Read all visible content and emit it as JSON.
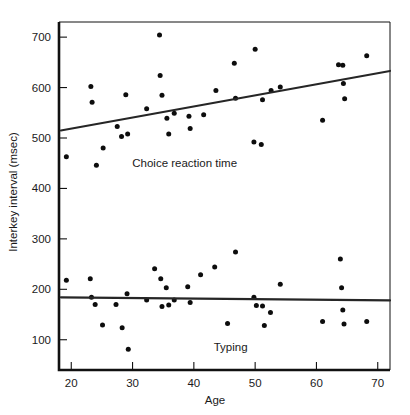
{
  "chart_data": {
    "type": "scatter",
    "title": "",
    "xlabel": "Age",
    "ylabel": "Interkey interval (msec)",
    "xlim": [
      18,
      72
    ],
    "ylim": [
      40,
      730
    ],
    "xticks": [
      20,
      30,
      40,
      50,
      60,
      70
    ],
    "yticks": [
      100,
      200,
      300,
      400,
      500,
      600,
      700
    ],
    "grid": false,
    "legend_position": "inline-annotation",
    "annotations": [
      {
        "text": "Choice reaction time",
        "x": 38.5,
        "y": 443
      },
      {
        "text": "Typing",
        "x": 46.0,
        "y": 78
      }
    ],
    "series": [
      {
        "name": "Choice reaction time",
        "label": "Choice reaction time",
        "color": "#0d0d0d",
        "marker": "circle",
        "points": [
          [
            19.2,
            463
          ],
          [
            23.2,
            602
          ],
          [
            23.4,
            571
          ],
          [
            24.1,
            446
          ],
          [
            25.2,
            480
          ],
          [
            27.5,
            523
          ],
          [
            28.2,
            503
          ],
          [
            28.9,
            586
          ],
          [
            29.2,
            508
          ],
          [
            32.3,
            558
          ],
          [
            34.4,
            704
          ],
          [
            34.5,
            624
          ],
          [
            34.8,
            585
          ],
          [
            35.6,
            539
          ],
          [
            35.9,
            508
          ],
          [
            36.8,
            549
          ],
          [
            39.2,
            543
          ],
          [
            39.4,
            519
          ],
          [
            41.6,
            546
          ],
          [
            43.6,
            594
          ],
          [
            46.6,
            648
          ],
          [
            46.8,
            579
          ],
          [
            49.8,
            492
          ],
          [
            50.0,
            676
          ],
          [
            51.0,
            487
          ],
          [
            51.2,
            576
          ],
          [
            52.6,
            594
          ],
          [
            54.1,
            601
          ],
          [
            61.0,
            535
          ],
          [
            63.6,
            645
          ],
          [
            64.3,
            644
          ],
          [
            64.4,
            608
          ],
          [
            64.6,
            578
          ],
          [
            68.2,
            663
          ]
        ],
        "trend_line": {
          "x": [
            18.3,
            72.0
          ],
          "y": [
            515,
            633
          ]
        }
      },
      {
        "name": "Typing",
        "label": "Typing",
        "color": "#0d0d0d",
        "marker": "circle",
        "points": [
          [
            19.2,
            218
          ],
          [
            23.1,
            221
          ],
          [
            23.3,
            184
          ],
          [
            23.9,
            170
          ],
          [
            25.1,
            129
          ],
          [
            27.3,
            170
          ],
          [
            28.3,
            124
          ],
          [
            29.1,
            191
          ],
          [
            29.3,
            81
          ],
          [
            32.3,
            179
          ],
          [
            33.6,
            241
          ],
          [
            34.6,
            221
          ],
          [
            34.8,
            166
          ],
          [
            35.5,
            203
          ],
          [
            35.9,
            169
          ],
          [
            36.8,
            179
          ],
          [
            39.0,
            205
          ],
          [
            39.4,
            174
          ],
          [
            41.1,
            229
          ],
          [
            43.4,
            244
          ],
          [
            45.5,
            132
          ],
          [
            46.8,
            274
          ],
          [
            49.8,
            184
          ],
          [
            50.2,
            168
          ],
          [
            51.2,
            167
          ],
          [
            51.5,
            128
          ],
          [
            52.5,
            154
          ],
          [
            54.1,
            210
          ],
          [
            61.0,
            136
          ],
          [
            63.9,
            260
          ],
          [
            64.1,
            203
          ],
          [
            64.3,
            159
          ],
          [
            64.5,
            131
          ],
          [
            68.2,
            136
          ]
        ],
        "trend_line": {
          "x": [
            18.3,
            72.0
          ],
          "y": [
            184,
            178
          ]
        }
      }
    ]
  },
  "axes": {
    "x_title": "Age",
    "y_title": "Interkey interval (msec)",
    "x_tick_labels": [
      "20",
      "30",
      "40",
      "50",
      "60",
      "70"
    ],
    "y_tick_labels": [
      "100",
      "200",
      "300",
      "400",
      "500",
      "600",
      "700"
    ]
  }
}
